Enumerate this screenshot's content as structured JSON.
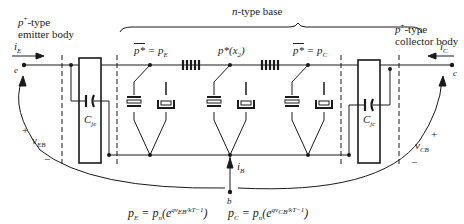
{
  "figure": {
    "regions": {
      "emitter": {
        "line1": "p+-type",
        "line1_sup": "+",
        "line1_base": "p",
        "line1_suffix": "-type",
        "line2": "emitter body"
      },
      "base": {
        "label": "n-type base",
        "italic": "n",
        "rest": "-type base"
      },
      "collector": {
        "line1_base": "p",
        "line1_sup": "+",
        "line1_suffix": "-type",
        "line2": "collector body"
      }
    },
    "nodes": {
      "pE": {
        "lhs": "p*",
        "rhs": "p",
        "rhs_sub": "E"
      },
      "px2": {
        "text": "p*(x",
        "sub": "2",
        "close": ")"
      },
      "pC": {
        "lhs": "p*",
        "rhs": "p",
        "rhs_sub": "C"
      }
    },
    "terminals": {
      "emitter": "e",
      "collector": "c",
      "base": "b"
    },
    "currents": {
      "iE": {
        "base": "i",
        "sub": "E"
      },
      "iC": {
        "base": "i",
        "sub": "C"
      },
      "iB": {
        "base": "i",
        "sub": "B"
      }
    },
    "capacitors": {
      "Cje": {
        "base": "C",
        "sub": "je"
      },
      "Cjc": {
        "base": "C",
        "sub": "jc"
      }
    },
    "voltages": {
      "vEB": {
        "base": "v",
        "sub": "EB",
        "plus": "+",
        "minus": "−"
      },
      "vCB": {
        "base": "v",
        "sub": "CB",
        "plus": "+",
        "minus": "−"
      }
    },
    "equations": {
      "left": {
        "lhs": "p",
        "lhs_sub": "E",
        "eq": " = p",
        "n_sub": "n",
        "open": "(e",
        "exp": "qv",
        "exp_sub": "EB",
        "exp_rest": "/kT−1",
        "close": ")"
      },
      "right": {
        "lhs": "p",
        "lhs_sub": "C",
        "eq": " = p",
        "n_sub": "n",
        "open": "(e",
        "exp": "qv",
        "exp_sub": "CB",
        "exp_rest": "/kT−1",
        "close": ")"
      }
    },
    "colors": {
      "ink": "#1a1a1a",
      "background": "#ffffff"
    }
  }
}
